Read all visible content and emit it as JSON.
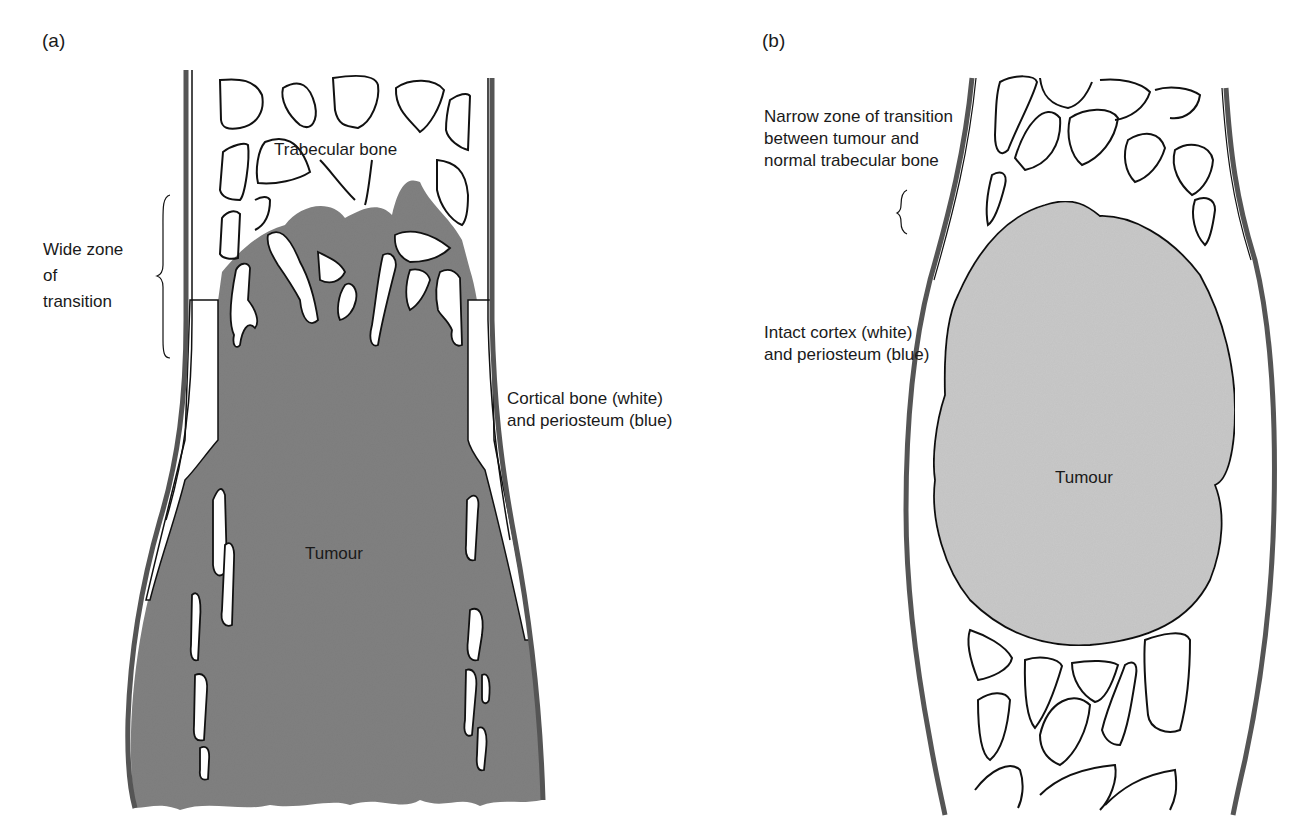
{
  "figure": {
    "panels": [
      {
        "id": "a",
        "panel_label": "(a)",
        "labels": {
          "trabecular": "Trabecular bone",
          "wide_zone": "Wide zone\nof\ntransition",
          "cortical": "Cortical bone (white)\nand periosteum (blue)",
          "tumour": "Tumour"
        }
      },
      {
        "id": "b",
        "panel_label": "(b)",
        "labels": {
          "narrow_zone": "Narrow zone of transition\nbetween tumour and\nnormal trabecular bone",
          "intact_cortex": "Intact cortex (white)\nand periosteum (blue)",
          "tumour": "Tumour"
        }
      }
    ],
    "colors": {
      "periosteum": "#555555",
      "outline": "#111111",
      "tumour_a": "#808080",
      "tumour_b": "#c8c8c8",
      "bone": "#ffffff"
    }
  }
}
